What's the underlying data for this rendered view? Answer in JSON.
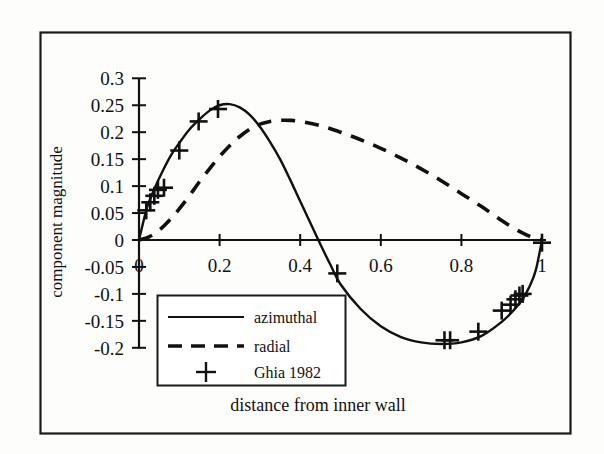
{
  "figure": {
    "border_color": "#1a1a1a",
    "background": "#fdfdfc",
    "line_color": "#111111"
  },
  "chart_data": {
    "type": "line",
    "title": "",
    "subtitle": "",
    "xlabel": "distance from inner wall",
    "ylabel": "component magnitude",
    "xlim": [
      0,
      1
    ],
    "ylim": [
      -0.2,
      0.3
    ],
    "grid": false,
    "legend_position": "lower-left-inside",
    "x_ticks": [
      0,
      0.2,
      0.4,
      0.6,
      0.8,
      1
    ],
    "x_tick_labels": [
      "0",
      "0.2",
      "0.4",
      "0.6",
      "0.8",
      "1"
    ],
    "y_ticks": [
      0.3,
      0.25,
      0.2,
      0.15,
      0.1,
      0.05,
      0,
      -0.05,
      -0.1,
      -0.15,
      -0.2
    ],
    "y_tick_labels": [
      "0.3",
      "0.25",
      "0.2",
      "0.15",
      "0.1",
      "0.05",
      "0",
      "-0.05",
      "-0.1",
      "-0.15",
      "-0.2"
    ],
    "series": [
      {
        "name": "azimuthal",
        "style": "solid",
        "x": [
          0.0,
          0.02,
          0.04,
          0.06,
          0.08,
          0.1,
          0.125,
          0.15,
          0.175,
          0.2,
          0.225,
          0.25,
          0.275,
          0.3,
          0.325,
          0.35,
          0.375,
          0.4,
          0.425,
          0.45,
          0.475,
          0.5,
          0.55,
          0.6,
          0.65,
          0.7,
          0.75,
          0.8,
          0.85,
          0.9,
          0.93,
          0.95,
          0.97,
          0.985,
          1.0
        ],
        "y": [
          0.0,
          0.06,
          0.098,
          0.13,
          0.158,
          0.18,
          0.205,
          0.224,
          0.24,
          0.25,
          0.252,
          0.246,
          0.232,
          0.21,
          0.182,
          0.15,
          0.112,
          0.072,
          0.032,
          -0.008,
          -0.046,
          -0.082,
          -0.128,
          -0.16,
          -0.18,
          -0.19,
          -0.193,
          -0.19,
          -0.178,
          -0.152,
          -0.13,
          -0.112,
          -0.085,
          -0.055,
          0.0
        ]
      },
      {
        "name": "radial",
        "style": "dashed",
        "x": [
          0.0,
          0.025,
          0.05,
          0.075,
          0.1,
          0.125,
          0.15,
          0.175,
          0.2,
          0.225,
          0.25,
          0.28,
          0.3,
          0.325,
          0.35,
          0.375,
          0.4,
          0.45,
          0.5,
          0.55,
          0.6,
          0.65,
          0.7,
          0.75,
          0.8,
          0.85,
          0.9,
          0.93,
          0.96,
          0.98,
          1.0
        ],
        "y": [
          0.0,
          0.006,
          0.018,
          0.036,
          0.058,
          0.082,
          0.108,
          0.132,
          0.155,
          0.175,
          0.192,
          0.208,
          0.215,
          0.22,
          0.222,
          0.222,
          0.22,
          0.212,
          0.2,
          0.186,
          0.17,
          0.152,
          0.132,
          0.11,
          0.086,
          0.062,
          0.036,
          0.022,
          0.01,
          0.004,
          0.0
        ]
      }
    ],
    "markers": {
      "name": "Ghia 1982",
      "symbol": "plus",
      "points": [
        {
          "x": 0.018,
          "y": 0.055
        },
        {
          "x": 0.028,
          "y": 0.07
        },
        {
          "x": 0.038,
          "y": 0.082
        },
        {
          "x": 0.047,
          "y": 0.093
        },
        {
          "x": 0.062,
          "y": 0.097
        },
        {
          "x": 0.1,
          "y": 0.166
        },
        {
          "x": 0.148,
          "y": 0.22
        },
        {
          "x": 0.196,
          "y": 0.243
        },
        {
          "x": 0.492,
          "y": -0.062
        },
        {
          "x": 0.758,
          "y": -0.186
        },
        {
          "x": 0.772,
          "y": -0.186
        },
        {
          "x": 0.842,
          "y": -0.17
        },
        {
          "x": 0.9,
          "y": -0.131
        },
        {
          "x": 0.922,
          "y": -0.12
        },
        {
          "x": 0.934,
          "y": -0.11
        },
        {
          "x": 0.944,
          "y": -0.103
        },
        {
          "x": 0.952,
          "y": -0.1
        },
        {
          "x": 1.0,
          "y": -0.005
        }
      ]
    },
    "legend_entries": [
      {
        "label": "azimuthal",
        "style": "solid"
      },
      {
        "label": "radial",
        "style": "dashed"
      },
      {
        "label": "Ghia 1982",
        "style": "marker"
      }
    ]
  }
}
